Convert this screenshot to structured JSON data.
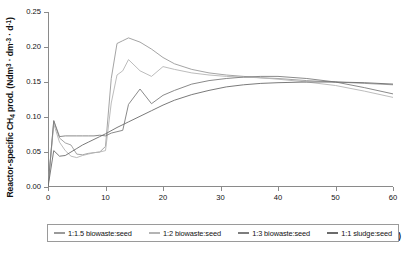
{
  "chart_data": {
    "type": "line",
    "title": "",
    "xlabel": "Time (d)",
    "ylabel": "Reactor-specific CH4 prod. (Ndm3 · dm-3 · d-1)",
    "xlim": [
      0,
      60
    ],
    "ylim": [
      0.0,
      0.25
    ],
    "xticks": [
      0,
      10,
      20,
      30,
      40,
      50,
      60
    ],
    "yticks": [
      "0.00",
      "0.05",
      "0.10",
      "0.15",
      "0.20",
      "0.25"
    ],
    "grid": false,
    "legend_position": "bottom",
    "series": [
      {
        "name": "1:1.5 biowaste:seed",
        "color": "#9a9a9a",
        "x": [
          0,
          1,
          2,
          3,
          4,
          5,
          6,
          7,
          8,
          9,
          10,
          11,
          12,
          13,
          14,
          16,
          18,
          20,
          22,
          25,
          28,
          31,
          34,
          37,
          40,
          45,
          50,
          55,
          60
        ],
        "y": [
          0.0,
          0.094,
          0.07,
          0.063,
          0.06,
          0.047,
          0.046,
          0.048,
          0.049,
          0.05,
          0.058,
          0.155,
          0.205,
          0.209,
          0.213,
          0.207,
          0.197,
          0.185,
          0.176,
          0.168,
          0.163,
          0.16,
          0.158,
          0.156,
          0.155,
          0.152,
          0.15,
          0.148,
          0.146
        ]
      },
      {
        "name": "1:2 biowaste:seed",
        "color": "#b4b4b4",
        "x": [
          0,
          1,
          2,
          3,
          4,
          5,
          6,
          7,
          8,
          9,
          10,
          11,
          12,
          13,
          14,
          16,
          18,
          20,
          22,
          25,
          28,
          31,
          34,
          37,
          40,
          45,
          50,
          55,
          60
        ],
        "y": [
          0.0,
          0.09,
          0.064,
          0.052,
          0.044,
          0.042,
          0.045,
          0.047,
          0.049,
          0.05,
          0.052,
          0.12,
          0.16,
          0.166,
          0.182,
          0.166,
          0.158,
          0.172,
          0.168,
          0.163,
          0.16,
          0.158,
          0.157,
          0.156,
          0.154,
          0.15,
          0.145,
          0.137,
          0.128
        ]
      },
      {
        "name": "1:3 biowaste:seed",
        "color": "#7d7d7d",
        "x": [
          0,
          1,
          2,
          3,
          4,
          5,
          6,
          7,
          8,
          9,
          10,
          11,
          12,
          13,
          14,
          16,
          18,
          20,
          22,
          25,
          28,
          31,
          34,
          37,
          40,
          45,
          50,
          55,
          60
        ],
        "y": [
          0.0,
          0.095,
          0.072,
          0.073,
          0.073,
          0.073,
          0.073,
          0.073,
          0.073,
          0.074,
          0.073,
          0.077,
          0.079,
          0.081,
          0.118,
          0.14,
          0.119,
          0.131,
          0.138,
          0.147,
          0.152,
          0.155,
          0.157,
          0.158,
          0.158,
          0.155,
          0.15,
          0.142,
          0.133
        ]
      },
      {
        "name": "1:1 sludge:seed",
        "color": "#6b6b6b",
        "x": [
          0,
          1,
          2,
          3,
          4,
          5,
          6,
          7,
          8,
          9,
          10,
          12,
          14,
          16,
          18,
          20,
          22,
          25,
          28,
          31,
          34,
          37,
          40,
          45,
          50,
          55,
          60
        ],
        "y": [
          0.0,
          0.052,
          0.044,
          0.045,
          0.05,
          0.055,
          0.06,
          0.064,
          0.068,
          0.072,
          0.076,
          0.085,
          0.093,
          0.101,
          0.109,
          0.117,
          0.124,
          0.132,
          0.138,
          0.143,
          0.146,
          0.148,
          0.149,
          0.15,
          0.15,
          0.149,
          0.147
        ]
      }
    ]
  },
  "axes": {
    "ylabel_html": "Reactor-specific CH<sub>4</sub> prod. (Ndm<sup>3</sup> &middot; dm<sup>-3</sup> &middot; d<sup>-1</sup>)",
    "xlabel": "Time (d)"
  },
  "legend": {
    "items": [
      {
        "label": "1:1.5 biowaste:seed",
        "color": "#9a9a9a"
      },
      {
        "label": "1:2 biowaste:seed",
        "color": "#b4b4b4"
      },
      {
        "label": "1:3 biowaste:seed",
        "color": "#7d7d7d"
      },
      {
        "label": "1:1 sludge:seed",
        "color": "#6b6b6b"
      }
    ]
  }
}
